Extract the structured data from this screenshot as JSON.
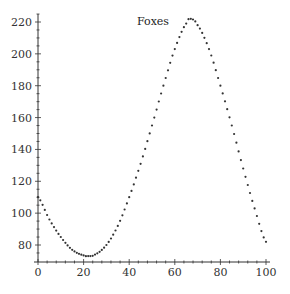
{
  "chart_data": {
    "type": "scatter",
    "title": "Foxes",
    "xlabel": "",
    "ylabel": "",
    "xlim": [
      0,
      100
    ],
    "ylim": [
      70,
      225
    ],
    "xticks": [
      0,
      20,
      40,
      60,
      80,
      100
    ],
    "yticks": [
      80,
      100,
      120,
      140,
      160,
      180,
      200,
      220
    ],
    "grid": false,
    "legend": "none",
    "marker_color": "#333333",
    "series": [
      {
        "name": "Foxes",
        "x": [
          0,
          5,
          10,
          15,
          20,
          22,
          25,
          30,
          35,
          40,
          45,
          50,
          55,
          60,
          65,
          67,
          70,
          75,
          80,
          85,
          90,
          95,
          100
        ],
        "values": [
          110,
          96,
          85,
          77,
          73.5,
          73,
          74,
          80,
          92,
          110,
          131,
          155,
          180,
          203,
          219,
          222,
          218,
          203,
          180,
          155,
          128,
          103,
          82
        ]
      }
    ]
  }
}
